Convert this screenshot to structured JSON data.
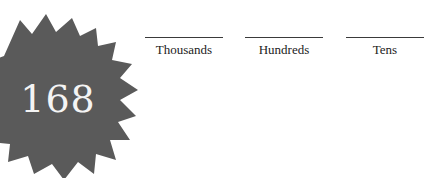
{
  "badge": {
    "number": "168",
    "fill_color": "#5a5a5a",
    "text_color": "#f4f4f4"
  },
  "place_values": [
    {
      "label": "Thousands",
      "answer": ""
    },
    {
      "label": "Hundreds",
      "answer": ""
    },
    {
      "label": "Tens",
      "answer": ""
    }
  ]
}
